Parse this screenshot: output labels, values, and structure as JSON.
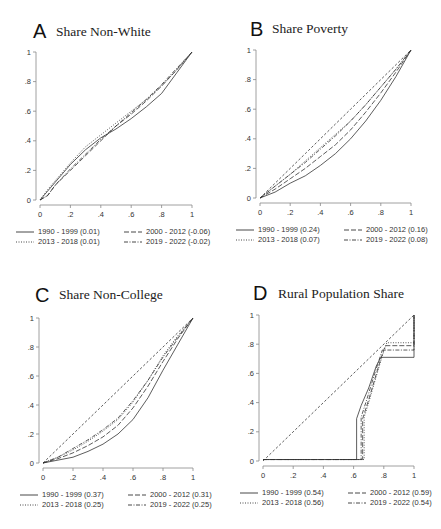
{
  "figure": {
    "panels": [
      {
        "letter": "A",
        "title": "Share Non-White"
      },
      {
        "letter": "B",
        "title": "Share Poverty"
      },
      {
        "letter": "C",
        "title": "Share Non-College"
      },
      {
        "letter": "D",
        "title": "Rural Population Share"
      }
    ],
    "ticks": [
      "0",
      ".2",
      ".4",
      ".6",
      ".8",
      "1"
    ]
  },
  "chart_data": [
    {
      "type": "line",
      "title": "Share Non-White",
      "panel": "A",
      "xlabel": "",
      "ylabel": "",
      "xlim": [
        0,
        1
      ],
      "ylim": [
        0,
        1
      ],
      "x_ticks": [
        "0",
        ".2",
        ".4",
        ".6",
        ".8",
        "1"
      ],
      "y_ticks": [
        "0",
        ".2",
        ".4",
        ".6",
        ".8",
        "1"
      ],
      "grid": false,
      "legend_position": "bottom",
      "x": [
        0,
        0.05,
        0.1,
        0.2,
        0.3,
        0.4,
        0.5,
        0.6,
        0.7,
        0.8,
        0.9,
        1.0
      ],
      "series": [
        {
          "name": "1990 - 1999 (0.01)",
          "style": "solid",
          "values": [
            0,
            0.06,
            0.12,
            0.24,
            0.34,
            0.42,
            0.48,
            0.55,
            0.63,
            0.72,
            0.86,
            1.0
          ]
        },
        {
          "name": "2000 - 2012 (-0.06)",
          "style": "longdash",
          "values": [
            0,
            0.03,
            0.1,
            0.2,
            0.3,
            0.4,
            0.5,
            0.58,
            0.67,
            0.77,
            0.88,
            1.0
          ]
        },
        {
          "name": "2013 - 2018 (0.01)",
          "style": "dotted",
          "values": [
            0,
            0.07,
            0.13,
            0.25,
            0.36,
            0.44,
            0.52,
            0.6,
            0.68,
            0.77,
            0.88,
            1.0
          ]
        },
        {
          "name": "2019 - 2022 (-0.02)",
          "style": "dashdot",
          "values": [
            0,
            0.03,
            0.1,
            0.21,
            0.31,
            0.41,
            0.5,
            0.59,
            0.68,
            0.78,
            0.89,
            1.0
          ]
        }
      ]
    },
    {
      "type": "line",
      "title": "Share Poverty",
      "panel": "B",
      "xlabel": "",
      "ylabel": "",
      "xlim": [
        0,
        1
      ],
      "ylim": [
        0,
        1
      ],
      "x_ticks": [
        "0",
        ".2",
        ".4",
        ".6",
        ".8",
        "1"
      ],
      "y_ticks": [
        "0",
        ".2",
        ".4",
        ".6",
        ".8",
        "1"
      ],
      "grid": false,
      "legend_position": "bottom",
      "x": [
        0,
        0.1,
        0.2,
        0.3,
        0.4,
        0.5,
        0.6,
        0.7,
        0.8,
        0.9,
        1.0
      ],
      "series": [
        {
          "name": "1990 - 1999 (0.24)",
          "style": "solid",
          "values": [
            0,
            0.04,
            0.1,
            0.15,
            0.22,
            0.3,
            0.4,
            0.52,
            0.66,
            0.82,
            1.0
          ]
        },
        {
          "name": "2000 - 2012 (0.16)",
          "style": "longdash",
          "values": [
            0,
            0.06,
            0.13,
            0.2,
            0.28,
            0.36,
            0.46,
            0.58,
            0.71,
            0.85,
            1.0
          ]
        },
        {
          "name": "2013 - 2018 (0.07)",
          "style": "dotted",
          "values": [
            0,
            0.08,
            0.16,
            0.25,
            0.34,
            0.43,
            0.52,
            0.63,
            0.75,
            0.87,
            1.0
          ]
        },
        {
          "name": "2019 - 2022 (0.08)",
          "style": "dashdot",
          "values": [
            0,
            0.08,
            0.16,
            0.24,
            0.33,
            0.42,
            0.52,
            0.63,
            0.75,
            0.87,
            1.0
          ]
        },
        {
          "name": "45-degree line",
          "style": "shortdash",
          "values": [
            0,
            0.1,
            0.2,
            0.3,
            0.4,
            0.5,
            0.6,
            0.7,
            0.8,
            0.9,
            1.0
          ]
        }
      ]
    },
    {
      "type": "line",
      "title": "Share Non-College",
      "panel": "C",
      "xlabel": "",
      "ylabel": "",
      "xlim": [
        0,
        1
      ],
      "ylim": [
        0,
        1
      ],
      "x_ticks": [
        "0",
        ".2",
        ".4",
        ".6",
        ".8",
        "1"
      ],
      "y_ticks": [
        "0",
        ".2",
        ".4",
        ".6",
        ".8",
        "1"
      ],
      "grid": false,
      "legend_position": "bottom",
      "x": [
        0,
        0.1,
        0.2,
        0.3,
        0.4,
        0.5,
        0.6,
        0.7,
        0.8,
        0.9,
        1.0
      ],
      "series": [
        {
          "name": "1990 - 1999 (0.37)",
          "style": "solid",
          "values": [
            0,
            0.02,
            0.04,
            0.08,
            0.13,
            0.2,
            0.3,
            0.45,
            0.64,
            0.82,
            1.0
          ]
        },
        {
          "name": "2000 - 2012 (0.31)",
          "style": "longdash",
          "values": [
            0,
            0.03,
            0.07,
            0.12,
            0.18,
            0.26,
            0.38,
            0.53,
            0.7,
            0.86,
            1.0
          ]
        },
        {
          "name": "2013 - 2018 (0.25)",
          "style": "dotted",
          "values": [
            0,
            0.04,
            0.09,
            0.15,
            0.22,
            0.3,
            0.42,
            0.57,
            0.74,
            0.88,
            1.0
          ]
        },
        {
          "name": "2019 - 2022 (0.25)",
          "style": "dashdot",
          "values": [
            0,
            0.04,
            0.1,
            0.16,
            0.23,
            0.31,
            0.43,
            0.57,
            0.73,
            0.87,
            1.0
          ]
        },
        {
          "name": "45-degree line",
          "style": "shortdash",
          "values": [
            0,
            0.1,
            0.2,
            0.3,
            0.4,
            0.5,
            0.6,
            0.7,
            0.8,
            0.9,
            1.0
          ]
        }
      ]
    },
    {
      "type": "line",
      "title": "Rural Population Share",
      "panel": "D",
      "xlabel": "",
      "ylabel": "",
      "xlim": [
        0,
        1
      ],
      "ylim": [
        0,
        1
      ],
      "x_ticks": [
        "0",
        ".2",
        ".4",
        ".6",
        ".8",
        "1"
      ],
      "y_ticks": [
        "0",
        ".2",
        ".4",
        ".6",
        ".8",
        "1"
      ],
      "grid": false,
      "legend_position": "bottom",
      "series": [
        {
          "name": "1990 - 1999 (0.54)",
          "style": "solid",
          "points": [
            [
              0,
              0.01
            ],
            [
              0.62,
              0.01
            ],
            [
              0.62,
              0.29
            ],
            [
              0.65,
              0.38
            ],
            [
              0.7,
              0.5
            ],
            [
              0.75,
              0.65
            ],
            [
              0.78,
              0.71
            ],
            [
              1.0,
              0.71
            ],
            [
              1.0,
              1.0
            ]
          ]
        },
        {
          "name": "2000 - 2012 (0.59)",
          "style": "longdash",
          "points": [
            [
              0,
              0.01
            ],
            [
              0.66,
              0.01
            ],
            [
              0.66,
              0.29
            ],
            [
              0.7,
              0.42
            ],
            [
              0.74,
              0.56
            ],
            [
              0.78,
              0.7
            ],
            [
              0.81,
              0.79
            ],
            [
              1.0,
              0.79
            ],
            [
              1.0,
              1.0
            ]
          ]
        },
        {
          "name": "2013 - 2018 (0.56)",
          "style": "dotted",
          "points": [
            [
              0,
              0.01
            ],
            [
              0.67,
              0.01
            ],
            [
              0.67,
              0.3
            ],
            [
              0.7,
              0.4
            ],
            [
              0.75,
              0.58
            ],
            [
              0.79,
              0.72
            ],
            [
              0.82,
              0.81
            ],
            [
              1.0,
              0.81
            ],
            [
              1.0,
              1.0
            ]
          ]
        },
        {
          "name": "2019 - 2022 (0.54)",
          "style": "dashdot",
          "points": [
            [
              0,
              0.01
            ],
            [
              0.65,
              0.01
            ],
            [
              0.65,
              0.3
            ],
            [
              0.69,
              0.43
            ],
            [
              0.74,
              0.6
            ],
            [
              0.79,
              0.76
            ],
            [
              1.0,
              0.76
            ],
            [
              1.0,
              1.0
            ]
          ]
        },
        {
          "name": "45-degree line",
          "style": "shortdash",
          "points": [
            [
              0,
              0
            ],
            [
              1,
              1
            ]
          ]
        }
      ]
    }
  ]
}
